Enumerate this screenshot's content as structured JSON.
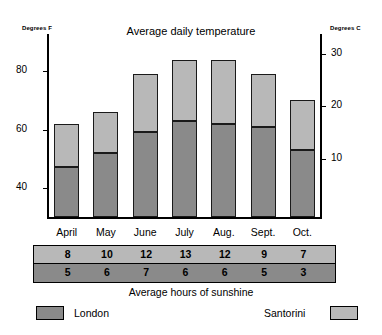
{
  "chart_data": {
    "type": "bar",
    "title": "Average daily temperature",
    "subtitle": "Average hours of sunshine",
    "categories": [
      "April",
      "May",
      "June",
      "July",
      "Aug.",
      "Sept.",
      "Oct."
    ],
    "series": [
      {
        "name": "London",
        "color": "#8a8a8a",
        "values": [
          47,
          52,
          59,
          63,
          62,
          61,
          53
        ],
        "sunshine_hours": [
          5,
          6,
          7,
          6,
          6,
          5,
          3
        ]
      },
      {
        "name": "Santorini",
        "color": "#b8b8b8",
        "values": [
          62,
          66,
          79,
          84,
          84,
          79,
          70
        ],
        "sunshine_hours": [
          8,
          10,
          12,
          13,
          12,
          9,
          7
        ]
      }
    ],
    "xlabel": "",
    "ylabel": "Degrees F",
    "y2label": "Degrees C",
    "ylim": [
      30,
      90
    ],
    "y2lim": [
      -1,
      32
    ],
    "yticks": [
      80,
      60,
      40
    ],
    "y2ticks": [
      30,
      20,
      10
    ],
    "grid": false,
    "legend_position": "bottom",
    "stacked_overlay": true
  },
  "axes": {
    "left_caption": "Degrees F",
    "right_caption": "Degrees C",
    "left_ticks": [
      "80",
      "60",
      "40"
    ],
    "right_ticks": [
      "30",
      "20",
      "10"
    ]
  },
  "title": "Average daily temperature",
  "sunshine_caption": "Average hours of sunshine",
  "months": [
    "April",
    "May",
    "June",
    "July",
    "Aug.",
    "Sept.",
    "Oct."
  ],
  "table": {
    "santorini_hours": [
      "8",
      "10",
      "12",
      "13",
      "12",
      "9",
      "7"
    ],
    "london_hours": [
      "5",
      "6",
      "7",
      "6",
      "6",
      "5",
      "3"
    ]
  },
  "legend": {
    "london": "London",
    "santorini": "Santorini"
  },
  "colors": {
    "london": "#8a8a8a",
    "santorini": "#b8b8b8",
    "outline": "#000000",
    "background": "#ffffff"
  }
}
